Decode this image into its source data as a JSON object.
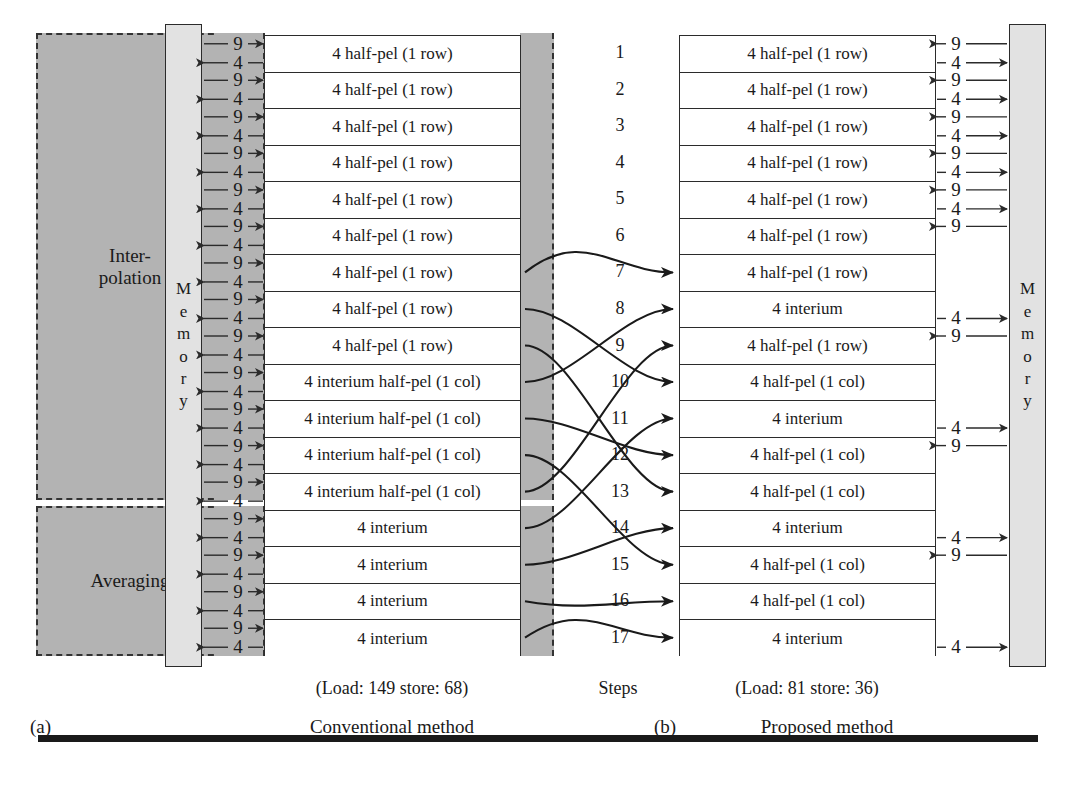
{
  "figure": {
    "type": "process-flow-comparison"
  },
  "left_panel": {
    "id_label": "(a)",
    "caption": "Conventional method",
    "cost_label": "(Load: 149 store: 68)",
    "loads_total": 149,
    "stores_total": 68,
    "memory_label": [
      "M",
      "e",
      "m",
      "o",
      "r",
      "y"
    ],
    "function_blocks": [
      {
        "name": "interpolation",
        "lines": [
          "Inter-",
          "polation"
        ]
      },
      {
        "name": "averaging",
        "lines": [
          "Averaging"
        ]
      }
    ],
    "rows": [
      "4 half-pel (1 row)",
      "4 half-pel (1 row)",
      "4 half-pel (1 row)",
      "4 half-pel (1 row)",
      "4 half-pel (1 row)",
      "4 half-pel (1 row)",
      "4 half-pel (1 row)",
      "4 half-pel (1 row)",
      "4 half-pel (1 row)",
      "4 interium half-pel (1 col)",
      "4 interium half-pel (1 col)",
      "4 interium half-pel (1 col)",
      "4 interium half-pel (1 col)",
      "4 interium",
      "4 interium",
      "4 interium",
      "4 interium"
    ],
    "ops": {
      "load_value": "9",
      "store_value": "4",
      "pattern": "every row has one load (9) and one store (4)"
    }
  },
  "steps": {
    "axis_label": "Steps",
    "numbers": [
      "1",
      "2",
      "3",
      "4",
      "5",
      "6",
      "7",
      "8",
      "9",
      "10",
      "11",
      "12",
      "13",
      "14",
      "15",
      "16",
      "17"
    ]
  },
  "right_panel": {
    "id_label": "(b)",
    "caption": "Proposed method",
    "cost_label": "(Load: 81 store: 36)",
    "loads_total": 81,
    "stores_total": 36,
    "memory_label": [
      "M",
      "e",
      "m",
      "o",
      "r",
      "y"
    ],
    "rows": [
      "4 half-pel (1 row)",
      "4 half-pel (1 row)",
      "4 half-pel (1 row)",
      "4 half-pel (1 row)",
      "4 half-pel (1 row)",
      "4 half-pel (1 row)",
      "4 half-pel (1 row)",
      "4 interium",
      "4 half-pel (1 row)",
      "4 half-pel (1 col)",
      "4 interium",
      "4 half-pel (1 col)",
      "4 half-pel (1 col)",
      "4 interium",
      "4 half-pel (1 col)",
      "4 half-pel (1 col)",
      "4 interium"
    ],
    "ops": {
      "load_value": "9",
      "store_value": "4"
    }
  },
  "colors": {
    "block_fill": "#b3b3b3",
    "memory_fill": "#e2e2e2",
    "line": "#2b2b2b",
    "row_fill": "#ffffff",
    "rule": "#1a1a1a"
  }
}
